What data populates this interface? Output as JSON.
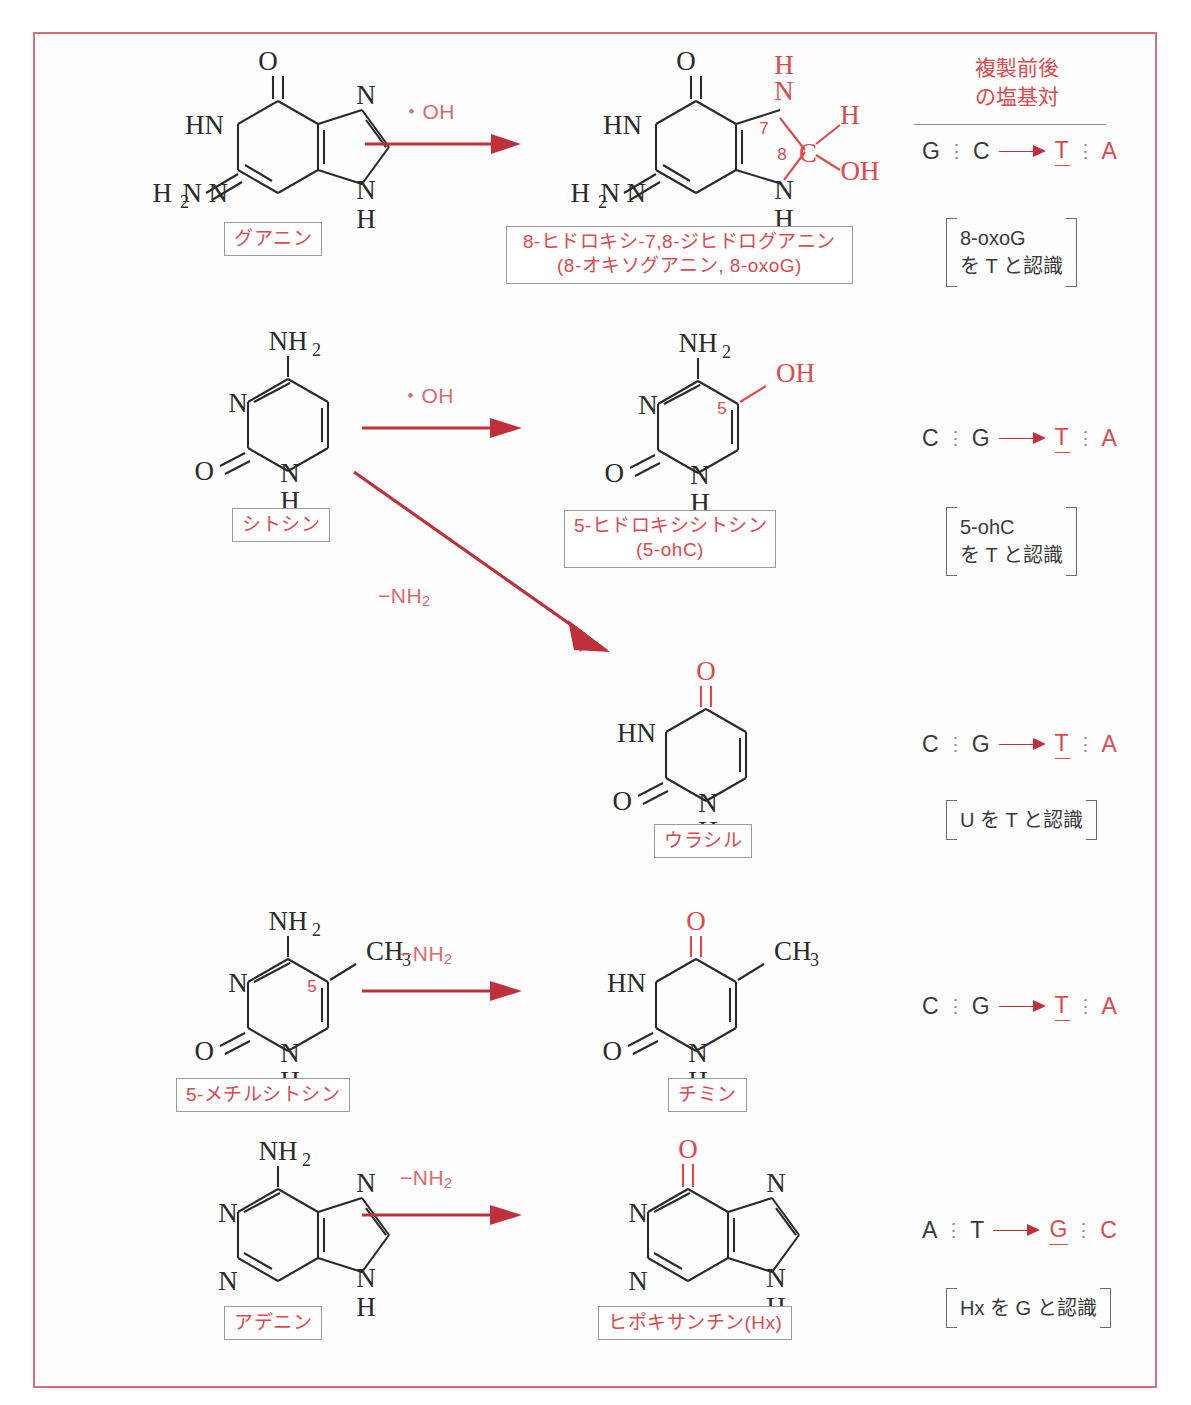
{
  "figure": {
    "type": "chemistry-reaction-diagram",
    "language": "ja",
    "frame_color": "#d4707a",
    "accent_color": "#e0484d",
    "arrow_color": "#c0303a"
  },
  "right_column": {
    "header_line1": "複製前後",
    "header_line2": "の塩基対"
  },
  "rows": [
    {
      "id": "guanine-to-8oxog",
      "reactant_label": "グアニン",
      "arrow_label": "・OH",
      "product_label_line1": "8-ヒドロキシ-7,8-ジヒドログアニン",
      "product_label_line2": "(8-オキソグアニン, 8-oxoG)",
      "pair": {
        "from_a": "G",
        "from_b": "C",
        "to_a": "T",
        "to_b": "A"
      },
      "note_line1": "8-oxoG",
      "note_line2": "を T と認識",
      "ring_numbers": [
        "7",
        "8"
      ],
      "added_groups": [
        "H",
        "OH",
        "C"
      ]
    },
    {
      "id": "cytosine-to-5ohc",
      "reactant_label": "シトシン",
      "arrow_label": "・OH",
      "product_label_line1": "5-ヒドロキシシトシン",
      "product_label_line2": "(5-ohC)",
      "pair": {
        "from_a": "C",
        "from_b": "G",
        "to_a": "T",
        "to_b": "A"
      },
      "note_line1": "5-ohC",
      "note_line2": "を T と認識",
      "ring_numbers": [
        "5"
      ],
      "added_groups": [
        "OH"
      ]
    },
    {
      "id": "cytosine-to-uracil",
      "reactant_label": "シトシン",
      "arrow_label": "−NH2",
      "product_label_line1": "ウラシル",
      "pair": {
        "from_a": "C",
        "from_b": "G",
        "to_a": "T",
        "to_b": "A"
      },
      "note_line1": "U を T と認識",
      "added_groups": [
        "O"
      ]
    },
    {
      "id": "5methylcytosine-to-thymine",
      "reactant_label": "5-メチルシトシン",
      "arrow_label": "−NH2",
      "product_label_line1": "チミン",
      "pair": {
        "from_a": "C",
        "from_b": "G",
        "to_a": "T",
        "to_b": "A"
      },
      "ring_numbers": [
        "5"
      ],
      "added_groups": [
        "CH3"
      ]
    },
    {
      "id": "adenine-to-hypoxanthine",
      "reactant_label": "アデニン",
      "arrow_label": "−NH2",
      "product_label_line1": "ヒポキサンチン(Hx)",
      "pair": {
        "from_a": "A",
        "from_b": "T",
        "to_a": "G",
        "to_b": "C"
      },
      "note_line1": "Hx を G と認識",
      "added_groups": [
        "O"
      ]
    }
  ]
}
